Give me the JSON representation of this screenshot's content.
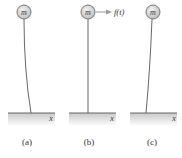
{
  "figure": {
    "panels": [
      {
        "id": "a",
        "caption": "(a)",
        "mass_label": "m",
        "axis_label": "x",
        "rod": "curved-right",
        "force_label": null
      },
      {
        "id": "b",
        "caption": "(b)",
        "mass_label": "m",
        "axis_label": "x",
        "rod": "straight",
        "force_label": "f(t)"
      },
      {
        "id": "c",
        "caption": "(c)",
        "mass_label": "m",
        "axis_label": "x",
        "rod": "curved-left",
        "force_label": null
      }
    ],
    "colors": {
      "mass_fill": "#d8d8d8",
      "mass_stroke": "#777777",
      "rod": "#555555",
      "ground_line": "#666666",
      "ground_shade": "#cfcfcf",
      "arrow": "#999999"
    }
  }
}
